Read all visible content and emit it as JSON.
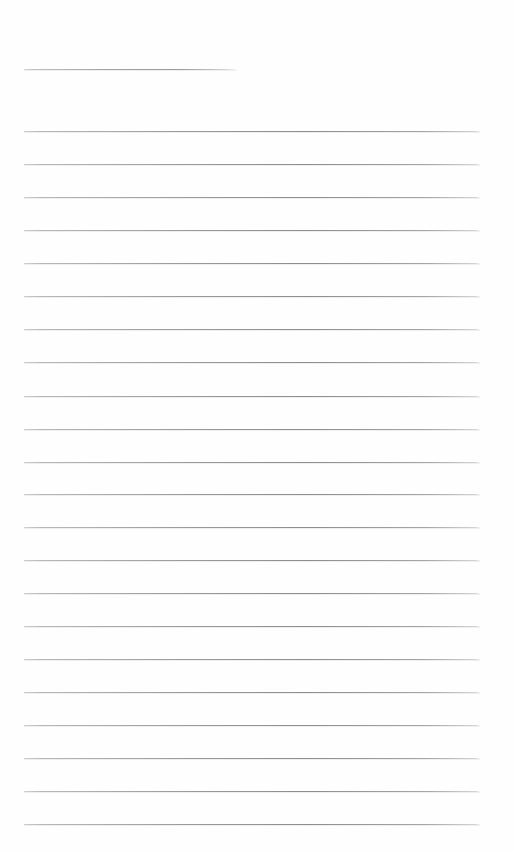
{
  "document": {
    "kind": "scanned-ruled-paper",
    "title": "",
    "page_width": 514,
    "page_height": 852,
    "background_color": "#fefefe",
    "rule_color": "#9a9a9e",
    "rule_thickness": 1,
    "margin_left": 24,
    "margin_right": 480,
    "line_spacing": 33.05,
    "visible_text": "",
    "line_count": 23
  },
  "rules": [
    {
      "name": "rule-line-1",
      "y": 69,
      "x1": 24,
      "x2": 237,
      "variant": "short"
    },
    {
      "name": "rule-line-2",
      "y": 131,
      "x1": 24,
      "x2": 480,
      "variant": "full"
    },
    {
      "name": "rule-line-3",
      "y": 164,
      "x1": 24,
      "x2": 480,
      "variant": "full"
    },
    {
      "name": "rule-line-4",
      "y": 197,
      "x1": 24,
      "x2": 480,
      "variant": "full"
    },
    {
      "name": "rule-line-5",
      "y": 230,
      "x1": 24,
      "x2": 480,
      "variant": "full"
    },
    {
      "name": "rule-line-6",
      "y": 263,
      "x1": 24,
      "x2": 480,
      "variant": "full"
    },
    {
      "name": "rule-line-7",
      "y": 296,
      "x1": 24,
      "x2": 480,
      "variant": "full"
    },
    {
      "name": "rule-line-8",
      "y": 329,
      "x1": 24,
      "x2": 480,
      "variant": "full"
    },
    {
      "name": "rule-line-9",
      "y": 362,
      "x1": 24,
      "x2": 480,
      "variant": "full"
    },
    {
      "name": "rule-line-10",
      "y": 396,
      "x1": 24,
      "x2": 480,
      "variant": "full"
    },
    {
      "name": "rule-line-11",
      "y": 429,
      "x1": 24,
      "x2": 480,
      "variant": "full"
    },
    {
      "name": "rule-line-12",
      "y": 462,
      "x1": 24,
      "x2": 480,
      "variant": "full"
    },
    {
      "name": "rule-line-13",
      "y": 494,
      "x1": 24,
      "x2": 480,
      "variant": "full"
    },
    {
      "name": "rule-line-14",
      "y": 527,
      "x1": 24,
      "x2": 480,
      "variant": "full"
    },
    {
      "name": "rule-line-15",
      "y": 560,
      "x1": 24,
      "x2": 480,
      "variant": "full"
    },
    {
      "name": "rule-line-16",
      "y": 593,
      "x1": 24,
      "x2": 480,
      "variant": "full"
    },
    {
      "name": "rule-line-17",
      "y": 626,
      "x1": 24,
      "x2": 480,
      "variant": "full"
    },
    {
      "name": "rule-line-18",
      "y": 659,
      "x1": 24,
      "x2": 480,
      "variant": "full"
    },
    {
      "name": "rule-line-19",
      "y": 692,
      "x1": 24,
      "x2": 480,
      "variant": "full"
    },
    {
      "name": "rule-line-20",
      "y": 725,
      "x1": 24,
      "x2": 480,
      "variant": "full"
    },
    {
      "name": "rule-line-21",
      "y": 758,
      "x1": 24,
      "x2": 480,
      "variant": "full"
    },
    {
      "name": "rule-line-22",
      "y": 791,
      "x1": 24,
      "x2": 480,
      "variant": "full"
    },
    {
      "name": "rule-line-23",
      "y": 824,
      "x1": 24,
      "x2": 480,
      "variant": "full"
    }
  ]
}
